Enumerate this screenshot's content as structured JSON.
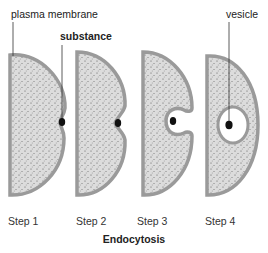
{
  "labels": {
    "plasma_membrane": "plasma membrane",
    "substance": "substance",
    "vesicle": "vesicle"
  },
  "steps": [
    {
      "label": "Step 1"
    },
    {
      "label": "Step 2"
    },
    {
      "label": "Step 3"
    },
    {
      "label": "Step 4"
    }
  ],
  "title": "Endocytosis",
  "colors": {
    "membrane": "#9a9a9a",
    "cytoplasm": "#d9d9d9",
    "dots": "#555555",
    "substance": "#111111",
    "vesicle_interior": "#ffffff"
  }
}
